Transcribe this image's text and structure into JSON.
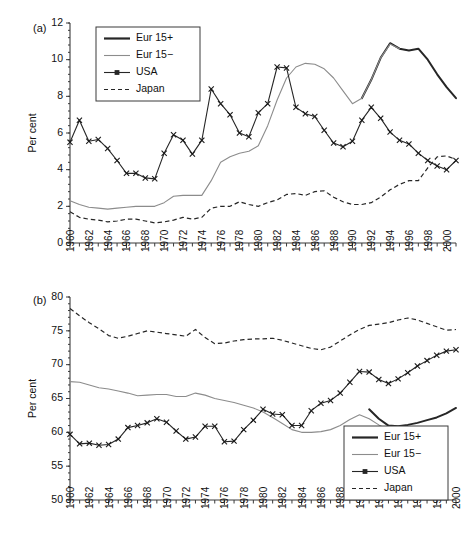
{
  "figure": {
    "panels": [
      {
        "id": "a",
        "label": "(a)",
        "ylabel": "Per cent"
      },
      {
        "id": "b",
        "label": "(b)",
        "ylabel": "Per cent"
      }
    ]
  },
  "legend": {
    "entries": [
      {
        "label": "Eur 15+",
        "style": "thick-solid-dark",
        "color": "#262626"
      },
      {
        "label": "Eur 15−",
        "style": "thin-solid-gray",
        "color": "#8c8c8c"
      },
      {
        "label": "USA",
        "style": "thin-solid-marker",
        "color": "#262626"
      },
      {
        "label": "Japan",
        "style": "dashed",
        "color": "#262626"
      }
    ]
  },
  "chart_data": [
    {
      "type": "line",
      "panel": "a",
      "title": "",
      "xlabel": "",
      "ylabel": "Per cent",
      "xlim": [
        1960,
        2001
      ],
      "ylim": [
        0,
        12
      ],
      "ytick_labels": [
        "0",
        "2",
        "4",
        "6",
        "8",
        "10",
        "12"
      ],
      "yticks": [
        0,
        2,
        4,
        6,
        8,
        10,
        12
      ],
      "xtick_labels": [
        "1960",
        "1962",
        "1964",
        "1966",
        "1968",
        "1970",
        "1972",
        "1974",
        "1976",
        "1978",
        "1980",
        "1982",
        "1984",
        "1986",
        "1988",
        "1990",
        "1992",
        "1994",
        "1996",
        "1998",
        "2000"
      ],
      "xticks_major": [
        1960,
        1962,
        1964,
        1966,
        1968,
        1970,
        1972,
        1974,
        1976,
        1978,
        1980,
        1982,
        1984,
        1986,
        1988,
        1990,
        1992,
        1994,
        1996,
        1998,
        2000
      ],
      "minor_tick_interval": 1,
      "grid": false,
      "legend_position": "upper-left",
      "x": [
        1960,
        1961,
        1962,
        1963,
        1964,
        1965,
        1966,
        1967,
        1968,
        1969,
        1970,
        1971,
        1972,
        1973,
        1974,
        1975,
        1976,
        1977,
        1978,
        1979,
        1980,
        1981,
        1982,
        1983,
        1984,
        1985,
        1986,
        1987,
        1988,
        1989,
        1990,
        1991,
        1992,
        1993,
        1994,
        1995,
        1996,
        1997,
        1998,
        1999,
        2000,
        2001
      ],
      "series": [
        {
          "name": "Eur 15+",
          "x": [
            1991,
            1992,
            1993,
            1994,
            1995,
            1996,
            1997,
            1998,
            1999,
            2000,
            2001
          ],
          "values": [
            7.9,
            8.9,
            10.1,
            10.9,
            10.6,
            10.5,
            10.6,
            10.0,
            9.2,
            8.5,
            7.9
          ]
        },
        {
          "name": "Eur 15−",
          "x": [
            1960,
            1961,
            1962,
            1963,
            1964,
            1965,
            1966,
            1967,
            1968,
            1969,
            1970,
            1971,
            1972,
            1973,
            1974,
            1975,
            1976,
            1977,
            1978,
            1979,
            1980,
            1981,
            1982,
            1983,
            1984,
            1985,
            1986,
            1987,
            1988,
            1989,
            1990,
            1991,
            1992,
            1993,
            1994,
            1995
          ],
          "values": [
            2.3,
            2.1,
            1.95,
            1.9,
            1.85,
            1.9,
            1.95,
            2.0,
            2.0,
            2.0,
            2.2,
            2.55,
            2.6,
            2.6,
            2.6,
            3.4,
            4.4,
            4.7,
            4.9,
            5.0,
            5.3,
            6.4,
            7.8,
            9.0,
            9.6,
            9.8,
            9.75,
            9.5,
            9.0,
            8.3,
            7.6,
            7.9,
            8.9,
            10.1,
            10.85,
            10.6
          ]
        },
        {
          "name": "USA",
          "x": [
            1960,
            1961,
            1962,
            1963,
            1964,
            1965,
            1966,
            1967,
            1968,
            1969,
            1970,
            1971,
            1972,
            1973,
            1974,
            1975,
            1976,
            1977,
            1978,
            1979,
            1980,
            1981,
            1982,
            1983,
            1984,
            1985,
            1986,
            1987,
            1988,
            1989,
            1990,
            1991,
            1992,
            1993,
            1994,
            1995,
            1996,
            1997,
            1998,
            1999,
            2000,
            2001
          ],
          "values": [
            5.5,
            6.7,
            5.55,
            5.65,
            5.15,
            4.5,
            3.8,
            3.8,
            3.55,
            3.5,
            4.9,
            5.9,
            5.6,
            4.85,
            5.6,
            8.4,
            7.6,
            7.0,
            6.0,
            5.8,
            7.1,
            7.6,
            9.6,
            9.55,
            7.4,
            7.05,
            6.9,
            6.15,
            5.45,
            5.25,
            5.55,
            6.7,
            7.4,
            6.8,
            6.05,
            5.6,
            5.4,
            4.9,
            4.5,
            4.2,
            4.0,
            4.5
          ]
        },
        {
          "name": "Japan",
          "x": [
            1960,
            1961,
            1962,
            1963,
            1964,
            1965,
            1966,
            1967,
            1968,
            1969,
            1970,
            1971,
            1972,
            1973,
            1974,
            1975,
            1976,
            1977,
            1978,
            1979,
            1980,
            1981,
            1982,
            1983,
            1984,
            1985,
            1986,
            1987,
            1988,
            1989,
            1990,
            1991,
            1992,
            1993,
            1994,
            1995,
            1996,
            1997,
            1998,
            1999,
            2000,
            2001
          ],
          "values": [
            1.7,
            1.4,
            1.3,
            1.25,
            1.15,
            1.2,
            1.3,
            1.3,
            1.2,
            1.1,
            1.15,
            1.25,
            1.4,
            1.3,
            1.4,
            1.9,
            2.0,
            2.0,
            2.25,
            2.1,
            2.0,
            2.2,
            2.35,
            2.65,
            2.7,
            2.6,
            2.8,
            2.85,
            2.5,
            2.25,
            2.1,
            2.1,
            2.2,
            2.5,
            2.9,
            3.2,
            3.4,
            3.4,
            4.1,
            4.7,
            4.75,
            4.55
          ]
        }
      ]
    },
    {
      "type": "line",
      "panel": "b",
      "title": "",
      "xlabel": "",
      "ylabel": "Per cent",
      "xlim": [
        1960,
        2000
      ],
      "ylim": [
        50,
        80
      ],
      "ytick_labels": [
        "50",
        "55",
        "60",
        "65",
        "70",
        "75",
        "80"
      ],
      "yticks": [
        50,
        55,
        60,
        65,
        70,
        75,
        80
      ],
      "xtick_labels": [
        "1960",
        "1962",
        "1964",
        "1966",
        "1968",
        "1970",
        "1972",
        "1974",
        "1976",
        "1978",
        "1980",
        "1982",
        "1984",
        "1986",
        "1988",
        "1990",
        "1992",
        "1994",
        "1996",
        "1998",
        "2000"
      ],
      "xticks_major": [
        1960,
        1962,
        1964,
        1966,
        1968,
        1970,
        1972,
        1974,
        1976,
        1978,
        1980,
        1982,
        1984,
        1986,
        1988,
        1990,
        1992,
        1994,
        1996,
        1998,
        2000
      ],
      "minor_tick_interval": 1,
      "grid": false,
      "legend_position": "lower-right",
      "series": [
        {
          "name": "Eur 15+",
          "x": [
            1991,
            1992,
            1993,
            1994,
            1995,
            1996,
            1997,
            1998,
            1999,
            2000
          ],
          "values": [
            63.4,
            62.0,
            61.0,
            60.9,
            61.1,
            61.4,
            61.8,
            62.2,
            62.8,
            63.6
          ]
        },
        {
          "name": "Eur 15−",
          "x": [
            1960,
            1961,
            1962,
            1963,
            1964,
            1965,
            1966,
            1967,
            1968,
            1969,
            1970,
            1971,
            1972,
            1973,
            1974,
            1975,
            1976,
            1977,
            1978,
            1979,
            1980,
            1981,
            1982,
            1983,
            1984,
            1985,
            1986,
            1987,
            1988,
            1989,
            1990,
            1991,
            1992,
            1993,
            1994,
            1995
          ],
          "values": [
            67.5,
            67.4,
            67.0,
            66.6,
            66.4,
            66.1,
            65.8,
            65.4,
            65.5,
            65.6,
            65.6,
            65.3,
            65.3,
            65.8,
            65.5,
            65.0,
            64.7,
            64.4,
            64.0,
            63.6,
            63.0,
            62.2,
            61.3,
            60.4,
            60.0,
            60.0,
            60.1,
            60.4,
            61.0,
            61.9,
            62.6,
            62.0,
            61.1,
            60.4,
            60.1,
            60.2
          ]
        },
        {
          "name": "USA",
          "x": [
            1960,
            1961,
            1962,
            1963,
            1964,
            1965,
            1966,
            1967,
            1968,
            1969,
            1970,
            1971,
            1972,
            1973,
            1974,
            1975,
            1976,
            1977,
            1978,
            1979,
            1980,
            1981,
            1982,
            1983,
            1984,
            1985,
            1986,
            1987,
            1988,
            1989,
            1990,
            1991,
            1992,
            1993,
            1994,
            1995,
            1996,
            1997,
            1998,
            1999,
            2000
          ],
          "values": [
            59.7,
            58.3,
            58.4,
            58.1,
            58.2,
            59.0,
            60.7,
            61.0,
            61.4,
            62.0,
            61.5,
            60.2,
            59.0,
            59.3,
            60.9,
            60.9,
            58.6,
            58.7,
            60.4,
            61.8,
            63.4,
            62.7,
            62.6,
            61.0,
            61.0,
            63.2,
            64.3,
            64.7,
            65.8,
            67.4,
            69.0,
            68.9,
            67.8,
            67.2,
            67.9,
            68.8,
            69.8,
            70.6,
            71.4,
            72.0,
            72.2
          ]
        },
        {
          "name": "Japan",
          "x": [
            1960,
            1961,
            1962,
            1963,
            1964,
            1965,
            1966,
            1967,
            1968,
            1969,
            1970,
            1971,
            1972,
            1973,
            1974,
            1975,
            1976,
            1977,
            1978,
            1979,
            1980,
            1981,
            1982,
            1983,
            1984,
            1985,
            1986,
            1987,
            1988,
            1989,
            1990,
            1991,
            1992,
            1993,
            1994,
            1995,
            1996,
            1997,
            1998,
            1999,
            2000
          ],
          "values": [
            78.3,
            77.2,
            76.2,
            75.3,
            74.3,
            73.9,
            74.2,
            74.6,
            75.0,
            74.8,
            74.6,
            74.4,
            74.2,
            75.2,
            74.0,
            73.1,
            73.2,
            73.5,
            73.7,
            73.8,
            73.8,
            73.9,
            73.6,
            73.2,
            72.8,
            72.4,
            72.2,
            72.6,
            73.5,
            74.4,
            75.2,
            75.8,
            76.0,
            76.2,
            76.6,
            76.9,
            76.6,
            76.1,
            75.6,
            75.1,
            75.2
          ]
        }
      ]
    }
  ]
}
